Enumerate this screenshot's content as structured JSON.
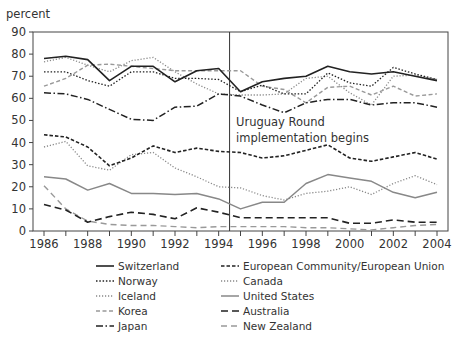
{
  "chart_data": {
    "type": "line",
    "title": "",
    "xlabel": "",
    "ylabel": "percent",
    "ylim": [
      0,
      90
    ],
    "xlim": [
      1986,
      2004
    ],
    "yticks": [
      0,
      10,
      20,
      30,
      40,
      50,
      60,
      70,
      80,
      90
    ],
    "xticks": [
      1986,
      1988,
      1990,
      1992,
      1994,
      1996,
      1998,
      2000,
      2002,
      2004
    ],
    "grid": false,
    "legend_position": "bottom",
    "x": [
      1986,
      1987,
      1988,
      1989,
      1990,
      1991,
      1992,
      1993,
      1994,
      1995,
      1996,
      1997,
      1998,
      1999,
      2000,
      2001,
      2002,
      2003,
      2004
    ],
    "series": [
      {
        "name": "Switzerland",
        "style": "solid",
        "color": "#222222",
        "width": 1.6,
        "values": [
          78,
          79,
          77.5,
          68,
          74.5,
          74.5,
          67.5,
          72.5,
          73.5,
          63,
          67.5,
          69,
          70,
          74.5,
          72,
          71,
          72,
          70,
          68
        ]
      },
      {
        "name": "Norway",
        "style": "dotted",
        "color": "#222222",
        "width": 1.3,
        "values": [
          72,
          72,
          68,
          65.5,
          72,
          72,
          69,
          69,
          68.5,
          63,
          66,
          62,
          62,
          71.5,
          67,
          65.5,
          74,
          71,
          68.5
        ]
      },
      {
        "name": "Iceland",
        "style": "dotted-light",
        "color": "#888888",
        "width": 1.3,
        "values": [
          76.5,
          78.5,
          75,
          72,
          77,
          78.5,
          72,
          66.5,
          62,
          61.5,
          61.5,
          62,
          69,
          70,
          62.5,
          57,
          70,
          70.5,
          68.5
        ]
      },
      {
        "name": "Korea",
        "style": "dashed-light",
        "color": "#999999",
        "width": 1.4,
        "values": [
          65.5,
          69,
          75,
          75.5,
          74.5,
          73.5,
          72.5,
          72.5,
          72.5,
          72.5,
          65.5,
          64,
          58,
          65,
          65.5,
          61.5,
          65.5,
          61,
          62
        ]
      },
      {
        "name": "Japan",
        "style": "dashdot",
        "color": "#222222",
        "width": 1.5,
        "values": [
          62.5,
          62,
          59.5,
          55,
          50.5,
          50,
          56,
          56.5,
          62,
          61,
          57,
          53.5,
          58,
          59.5,
          59.5,
          57,
          58,
          58,
          56
        ]
      },
      {
        "name": "European Community/European Union",
        "style": "dashed-short",
        "color": "#222222",
        "width": 1.6,
        "values": [
          43.5,
          42.5,
          38,
          29.5,
          33,
          38.5,
          35.5,
          37.5,
          36,
          35.5,
          33,
          34,
          36.5,
          39,
          33,
          31.5,
          33.5,
          35.5,
          32.5
        ]
      },
      {
        "name": "Canada",
        "style": "dotted-light",
        "color": "#888888",
        "width": 1.3,
        "values": [
          38,
          40.5,
          29.5,
          27.5,
          34.5,
          35.5,
          28.5,
          24.5,
          20,
          19.5,
          16,
          14,
          17,
          18,
          20,
          16.5,
          21.5,
          25,
          21
        ]
      },
      {
        "name": "United States",
        "style": "solid-light",
        "color": "#888888",
        "width": 1.5,
        "values": [
          24.5,
          23.5,
          18.5,
          21.5,
          17,
          17,
          16.5,
          17,
          14.5,
          10,
          13,
          13,
          21.5,
          25.5,
          24,
          22.5,
          17.5,
          15,
          17.5
        ]
      },
      {
        "name": "Australia",
        "style": "dashed-long",
        "color": "#222222",
        "width": 1.6,
        "values": [
          12,
          9.5,
          4,
          6.5,
          8.5,
          7.5,
          5.5,
          10.5,
          8.5,
          6,
          6,
          6,
          6,
          6,
          3.5,
          3.5,
          5,
          4,
          4
        ]
      },
      {
        "name": "New Zealand",
        "style": "dashed-light-long",
        "color": "#999999",
        "width": 1.4,
        "values": [
          20.5,
          10,
          4.5,
          3,
          2.5,
          2.5,
          2,
          1.5,
          2,
          2,
          2,
          2,
          1.5,
          1.5,
          1,
          0.5,
          1.5,
          2.5,
          3
        ]
      }
    ],
    "annotations": [
      {
        "type": "vline",
        "x": 1994.5,
        "text": "Uruguay Round implementation begins"
      }
    ]
  },
  "axis": {
    "ylabel": "percent",
    "ytick_labels": [
      "0",
      "10",
      "20",
      "30",
      "40",
      "50",
      "60",
      "70",
      "80",
      "90"
    ],
    "xtick_labels": [
      "1986",
      "1988",
      "1990",
      "1992",
      "1994",
      "1996",
      "1998",
      "2000",
      "2002",
      "2004"
    ]
  },
  "annotation": {
    "line1": "Uruguay Round",
    "line2": "implementation begins"
  },
  "legend": {
    "left": [
      "Switzerland",
      "Norway",
      "Iceland",
      "Korea",
      "Japan"
    ],
    "right": [
      "European Community/European Union",
      "Canada",
      "United States",
      "Australia",
      "New Zealand"
    ]
  }
}
